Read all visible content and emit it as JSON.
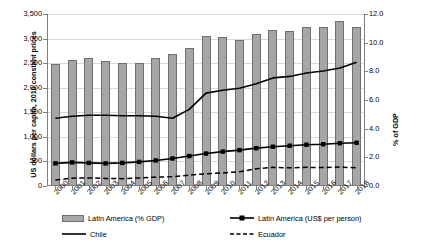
{
  "chart_data": {
    "type": "bar",
    "title": "",
    "subtitle": "",
    "xlabel": "",
    "ylabel": "US dollars per capita, 2010 constant prices",
    "y2label": "% of GDP",
    "categories": [
      "2000",
      "2001",
      "2002",
      "2003",
      "2004",
      "2005",
      "2006",
      "2007",
      "2008",
      "2009",
      "2010",
      "2011",
      "2012",
      "2013",
      "2014",
      "2015",
      "2016",
      "2017",
      "2018"
    ],
    "ylim": [
      0,
      3500
    ],
    "yticks": [
      "0",
      "500",
      "1,000",
      "1,500",
      "2,000",
      "2,500",
      "3,000",
      "3,500"
    ],
    "ytick_values": [
      0,
      500,
      1000,
      1500,
      2000,
      2500,
      3000,
      3500
    ],
    "y2lim": [
      0,
      12
    ],
    "y2ticks": [
      "0.0",
      "2.0",
      "4.0",
      "6.0",
      "8.0",
      "10.0",
      "12.0"
    ],
    "y2tick_values": [
      0,
      2,
      4,
      6,
      8,
      10,
      12
    ],
    "grid": true,
    "legend_position": "bottom",
    "series": [
      {
        "name": "Latin America (% GDP)",
        "render": "bar",
        "axis": "right",
        "color": "#a6a6a6",
        "edge_color": "#6f6f6f",
        "values": [
          8.5,
          8.8,
          8.9,
          8.7,
          8.6,
          8.6,
          8.9,
          9.2,
          9.6,
          10.5,
          10.4,
          10.2,
          10.6,
          10.9,
          10.8,
          11.1,
          11.1,
          11.5,
          11.1
        ]
      },
      {
        "name": "Latin America (US$ per person)",
        "render": "line-marker",
        "axis": "left",
        "color": "#000000",
        "marker": "square",
        "values": [
          460,
          480,
          470,
          460,
          470,
          490,
          520,
          560,
          610,
          660,
          700,
          730,
          770,
          800,
          820,
          840,
          850,
          870,
          880
        ]
      },
      {
        "name": "Chile",
        "render": "line",
        "axis": "left",
        "color": "#000000",
        "values": [
          1380,
          1420,
          1440,
          1440,
          1430,
          1430,
          1420,
          1380,
          1560,
          1890,
          1950,
          1990,
          2080,
          2200,
          2230,
          2300,
          2340,
          2400,
          2520
        ]
      },
      {
        "name": "Ecuador",
        "render": "line-dashed",
        "axis": "left",
        "color": "#000000",
        "values": [
          120,
          160,
          165,
          155,
          150,
          165,
          180,
          190,
          220,
          250,
          265,
          290,
          350,
          380,
          370,
          380,
          375,
          385,
          370
        ]
      }
    ],
    "legend_entries": [
      {
        "label": "Latin America (% GDP)",
        "style": "bar"
      },
      {
        "label": "Latin America (US$ per person)",
        "style": "line-marker"
      },
      {
        "label": "Chile",
        "style": "line"
      },
      {
        "label": "Ecuador",
        "style": "line-dashed"
      }
    ]
  }
}
